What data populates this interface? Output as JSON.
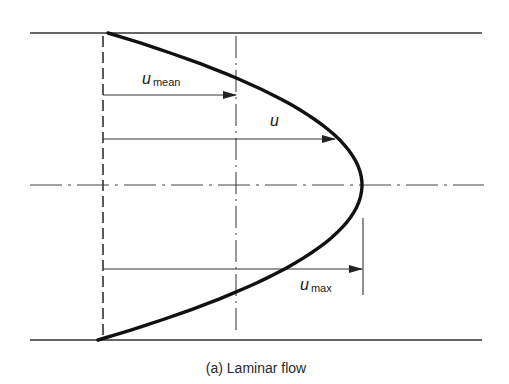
{
  "figure": {
    "caption": "(a) Laminar flow",
    "colors": {
      "line": "#222222",
      "profile": "#111111",
      "background": "#ffffff"
    }
  },
  "labels": {
    "u_mean": {
      "symbol": "u",
      "subscript": "mean"
    },
    "u": {
      "symbol": "u",
      "subscript": ""
    },
    "u_max": {
      "symbol": "u",
      "subscript": "max"
    }
  },
  "geometry": {
    "pipe_top_y": 33,
    "pipe_bottom_y": 340,
    "centerline_y": 185,
    "pipe_x_start": 30,
    "pipe_x_end": 482,
    "profile_origin_x": 103,
    "profile_vertex_x": 362,
    "mean_line_x": 236,
    "arrows": [
      {
        "name": "u_mean",
        "y": 95,
        "x_end": 236
      },
      {
        "name": "u",
        "y": 139,
        "x_end": 335
      },
      {
        "name": "u_max",
        "y": 269,
        "x_end": 362
      }
    ]
  }
}
